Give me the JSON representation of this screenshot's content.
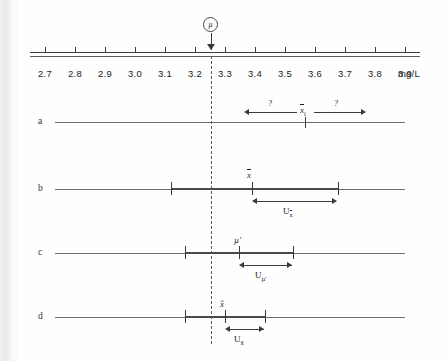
{
  "figure": {
    "type": "measurement-uncertainty-scale-diagram",
    "unit": "mg/L"
  },
  "scale": {
    "unit_label": "mg/L",
    "tick_labels": [
      "2.7",
      "2.8",
      "2.9",
      "3.0",
      "3.1",
      "3.2",
      "3.3",
      "3.4",
      "3.5",
      "3.6",
      "3.7",
      "3.8",
      "3.9"
    ],
    "range_min": 2.65,
    "range_max": 3.95,
    "callout": {
      "symbol": "µ",
      "value": "3.25",
      "description": "true-value-marker"
    }
  },
  "rows": [
    {
      "letter": "a",
      "center_symbol": "x",
      "center_subscript": "i",
      "center_value": "3.59",
      "left_arrow_label": "?",
      "right_arrow_label": "?",
      "arrow_left_value": "3.39",
      "arrow_right_value": "3.82"
    },
    {
      "letter": "b",
      "center_symbol": "x̄",
      "center_value": "3.40",
      "bar_min": "3.00",
      "bar_max": "3.72",
      "u_label": "U",
      "u_subscript": "x̄",
      "u_min": "3.40",
      "u_max": "3.72"
    },
    {
      "letter": "c",
      "center_symbol": "µ′",
      "center_value": "3.23",
      "bar_min": "3.04",
      "bar_max": "3.42",
      "u_label": "U",
      "u_subscript": "µ′",
      "u_min": "3.23",
      "u_max": "3.42"
    },
    {
      "letter": "d",
      "center_symbol": "x̂",
      "center_value": "3.19",
      "bar_min": "3.04",
      "bar_max": "3.35",
      "u_label": "U",
      "u_subscript": "x̂",
      "u_min": "3.19",
      "u_max": "3.35"
    }
  ],
  "chart_data": {
    "type": "scatter",
    "title": "",
    "xlabel": "mg/L",
    "ylabel": "",
    "xlim": [
      2.65,
      3.95
    ],
    "grid": false,
    "legend": "none",
    "reference_line": 3.25,
    "categories": [
      "a",
      "b",
      "c",
      "d"
    ],
    "series": [
      {
        "name": "a",
        "center": 3.59,
        "interval_low": 3.39,
        "interval_high": 3.82,
        "label": "x_i",
        "uncertainty_label": "?"
      },
      {
        "name": "b",
        "center": 3.4,
        "interval_low": 3.0,
        "interval_high": 3.72,
        "label": "x̄",
        "uncertainty_label": "U_x̄"
      },
      {
        "name": "c",
        "center": 3.23,
        "interval_low": 3.04,
        "interval_high": 3.42,
        "label": "µ′",
        "uncertainty_label": "U_µ′"
      },
      {
        "name": "d",
        "center": 3.19,
        "interval_low": 3.04,
        "interval_high": 3.35,
        "label": "x̂",
        "uncertainty_label": "U_x̂"
      }
    ]
  }
}
